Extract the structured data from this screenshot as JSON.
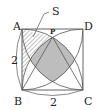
{
  "diagram": {
    "type": "geometry",
    "shape": "square ABCD with quarter-circle arcs",
    "labels": {
      "A": "A",
      "B": "B",
      "C": "C",
      "D": "D",
      "P": "P",
      "S": "S",
      "side_left": "2",
      "side_bottom": "2"
    },
    "colors": {
      "stroke": "#555555",
      "shaded": "#bdbdbd",
      "hatch": "#777777",
      "text": "#222222"
    }
  }
}
